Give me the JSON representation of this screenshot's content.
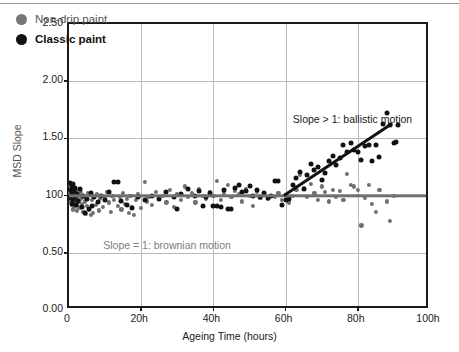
{
  "chart_data": {
    "type": "scatter",
    "title": "",
    "xlabel": "Ageing Time (hours)",
    "ylabel": "MSD Slope",
    "xlim": [
      0,
      100
    ],
    "ylim": [
      0.0,
      2.5
    ],
    "grid": true,
    "legend_position": "top-left",
    "x_ticks": [
      {
        "value": 0,
        "label": "0"
      },
      {
        "value": 20,
        "label": "20h"
      },
      {
        "value": 40,
        "label": "40h"
      },
      {
        "value": 60,
        "label": "60h"
      },
      {
        "value": 80,
        "label": "80h"
      },
      {
        "value": 100,
        "label": "100h"
      }
    ],
    "y_ticks": [
      {
        "value": 2.5,
        "label": "2.50"
      },
      {
        "value": 2.0,
        "label": "2.00"
      },
      {
        "value": 1.5,
        "label": "1.50"
      },
      {
        "value": 1.0,
        "label": "100"
      },
      {
        "value": 0.5,
        "label": "0.50"
      },
      {
        "value": 0.0,
        "label": "0.00"
      }
    ],
    "legend": [
      {
        "name": "Non-drip paint",
        "color": "#777777",
        "marker": "circle",
        "bold": false
      },
      {
        "name": "Classic paint",
        "color": "#111111",
        "marker": "circle",
        "bold": true
      }
    ],
    "annotations": [
      {
        "text": "Slope > 1: ballistic motion",
        "x": 62.0,
        "y": 1.72,
        "color": "#1a1a1a"
      },
      {
        "text": "Slope = 1: brownian motion",
        "x": 9.5,
        "y": 0.62,
        "color": "#7d7d7d"
      }
    ],
    "reference_lines": [
      {
        "name": "brownian",
        "type": "horizontal",
        "y": 1.0,
        "x_start": 0,
        "x_end": 100,
        "color": "#6f6f6f",
        "width": 3.4
      },
      {
        "name": "ballistic",
        "type": "segment",
        "x_start": 59.5,
        "y_start": 1.0,
        "x_end": 89.5,
        "y_end": 1.63,
        "color": "#111111",
        "width": 3.2
      }
    ],
    "series": [
      {
        "name": "Non-drip paint",
        "color": "#6f6f6f",
        "marker_size": 4.2,
        "points": [
          [
            0.3,
            1.09
          ],
          [
            0.4,
            1.02
          ],
          [
            0.5,
            0.95
          ],
          [
            0.5,
            1.06
          ],
          [
            0.6,
            0.99
          ],
          [
            0.7,
            0.92
          ],
          [
            0.8,
            1.04
          ],
          [
            0.9,
            0.97
          ],
          [
            1.0,
            1.01
          ],
          [
            1.0,
            0.88
          ],
          [
            1.1,
            1.07
          ],
          [
            1.2,
            0.94
          ],
          [
            1.3,
            1.0
          ],
          [
            1.4,
            0.9
          ],
          [
            1.5,
            1.03
          ],
          [
            1.6,
            0.96
          ],
          [
            1.7,
            1.05
          ],
          [
            1.8,
            0.93
          ],
          [
            1.9,
            0.99
          ],
          [
            2.0,
            1.02
          ],
          [
            2.1,
            0.87
          ],
          [
            2.2,
            0.98
          ],
          [
            2.3,
            1.04
          ],
          [
            2.4,
            0.91
          ],
          [
            2.5,
            1.0
          ],
          [
            2.6,
            0.95
          ],
          [
            2.8,
            1.01
          ],
          [
            3.0,
            0.89
          ],
          [
            3.2,
            0.97
          ],
          [
            3.4,
            1.03
          ],
          [
            3.6,
            0.93
          ],
          [
            3.8,
            0.99
          ],
          [
            4.0,
            0.86
          ],
          [
            4.2,
            1.0
          ],
          [
            4.4,
            0.95
          ],
          [
            4.6,
            0.84
          ],
          [
            4.8,
            0.98
          ],
          [
            5.0,
            0.91
          ],
          [
            5.3,
            1.02
          ],
          [
            5.6,
            0.88
          ],
          [
            6.0,
            0.83
          ],
          [
            6.3,
            0.96
          ],
          [
            6.6,
            0.85
          ],
          [
            7.0,
            0.99
          ],
          [
            7.4,
            0.92
          ],
          [
            7.8,
            1.01
          ],
          [
            8.2,
            0.87
          ],
          [
            8.6,
            0.97
          ],
          [
            9.0,
            1.0
          ],
          [
            9.5,
            0.9
          ],
          [
            10.0,
            0.98
          ],
          [
            10.5,
            1.03
          ],
          [
            11.0,
            0.94
          ],
          [
            11.5,
            0.86
          ],
          [
            12.0,
            1.0
          ],
          [
            12.5,
            0.96
          ],
          [
            13.0,
            1.12
          ],
          [
            13.5,
            0.91
          ],
          [
            14.0,
            0.99
          ],
          [
            14.5,
            0.88
          ],
          [
            15.0,
            1.02
          ],
          [
            15.5,
            0.93
          ],
          [
            16.0,
            0.97
          ],
          [
            16.5,
            0.85
          ],
          [
            17.0,
            1.0
          ],
          [
            17.5,
            0.9
          ],
          [
            18.0,
            0.83
          ],
          [
            18.5,
            0.96
          ],
          [
            19.0,
            1.01
          ],
          [
            20.0,
            0.89
          ],
          [
            21.0,
            1.12
          ],
          [
            21.5,
            0.95
          ],
          [
            22.0,
            0.99
          ],
          [
            23.0,
            0.92
          ],
          [
            24.0,
            1.03
          ],
          [
            25.0,
            0.97
          ],
          [
            26.0,
            1.0
          ],
          [
            27.0,
            0.94
          ],
          [
            28.0,
            1.05
          ],
          [
            29.0,
            0.9
          ],
          [
            30.0,
            1.01
          ],
          [
            31.0,
            0.96
          ],
          [
            32.0,
            1.08
          ],
          [
            33.0,
            0.99
          ],
          [
            34.0,
            1.02
          ],
          [
            35.0,
            0.94
          ],
          [
            36.0,
            1.06
          ],
          [
            37.0,
            1.0
          ],
          [
            38.0,
            0.97
          ],
          [
            39.0,
            1.03
          ],
          [
            40.0,
            1.0
          ],
          [
            41.0,
            1.13
          ],
          [
            42.0,
            0.96
          ],
          [
            43.0,
            1.02
          ],
          [
            44.0,
            1.09
          ],
          [
            45.0,
            0.99
          ],
          [
            46.0,
            1.04
          ],
          [
            47.0,
            1.01
          ],
          [
            48.0,
            0.95
          ],
          [
            49.0,
            1.06
          ],
          [
            50.0,
            1.0
          ],
          [
            51.0,
            0.91
          ],
          [
            52.0,
            1.03
          ],
          [
            53.0,
            0.98
          ],
          [
            54.0,
            1.01
          ],
          [
            55.0,
            0.97
          ],
          [
            56.0,
            1.0
          ],
          [
            57.0,
            0.99
          ],
          [
            58.0,
            1.02
          ],
          [
            59.0,
            0.96
          ],
          [
            60.0,
            1.0
          ],
          [
            61.0,
            0.94
          ],
          [
            62.0,
            1.0
          ],
          [
            63.0,
            1.05
          ],
          [
            64.0,
            1.18
          ],
          [
            65.0,
            1.07
          ],
          [
            66.0,
            0.99
          ],
          [
            67.0,
            1.1
          ],
          [
            68.0,
            1.02
          ],
          [
            69.0,
            0.96
          ],
          [
            70.0,
            1.08
          ],
          [
            71.0,
            1.03
          ],
          [
            72.0,
            0.95
          ],
          [
            73.0,
            1.05
          ],
          [
            74.0,
            0.99
          ],
          [
            75.0,
            1.04
          ],
          [
            76.0,
            0.96
          ],
          [
            77.0,
            1.19
          ],
          [
            78.0,
            1.09
          ],
          [
            79.0,
            1.08
          ],
          [
            80.0,
            1.05
          ],
          [
            81.0,
            0.74
          ],
          [
            82.0,
            0.98
          ],
          [
            83.0,
            1.09
          ],
          [
            84.0,
            0.93
          ],
          [
            85.0,
            0.86
          ],
          [
            86.0,
            1.05
          ],
          [
            88.0,
            0.95
          ],
          [
            89.0,
            0.78
          ],
          [
            90.0,
            1.0
          ]
        ]
      },
      {
        "name": "Classic paint",
        "color": "#121212",
        "marker_size": 5.0,
        "points": [
          [
            0.4,
            1.11
          ],
          [
            0.5,
            1.05
          ],
          [
            0.6,
            0.98
          ],
          [
            0.7,
            1.08
          ],
          [
            0.8,
            0.93
          ],
          [
            0.9,
            1.02
          ],
          [
            1.0,
            1.1
          ],
          [
            1.2,
            0.96
          ],
          [
            1.4,
            1.04
          ],
          [
            1.6,
            0.99
          ],
          [
            1.8,
            1.07
          ],
          [
            2.0,
            0.92
          ],
          [
            2.3,
            1.01
          ],
          [
            2.6,
            0.95
          ],
          [
            3.0,
            1.06
          ],
          [
            3.5,
            0.9
          ],
          [
            4.0,
            1.0
          ],
          [
            4.5,
            0.85
          ],
          [
            5.0,
            0.97
          ],
          [
            5.5,
            0.88
          ],
          [
            6.0,
            1.02
          ],
          [
            6.5,
            0.91
          ],
          [
            7.0,
            0.99
          ],
          [
            8.0,
            0.94
          ],
          [
            9.0,
            1.0
          ],
          [
            10.0,
            0.96
          ],
          [
            11.0,
            1.03
          ],
          [
            12.5,
            1.12
          ],
          [
            13.5,
            1.12
          ],
          [
            14.5,
            0.95
          ],
          [
            16.0,
            0.92
          ],
          [
            17.5,
            0.89
          ],
          [
            19.0,
            0.99
          ],
          [
            21.0,
            0.96
          ],
          [
            23.0,
            1.0
          ],
          [
            25.0,
            0.97
          ],
          [
            27.0,
            1.03
          ],
          [
            29.0,
            0.99
          ],
          [
            30.0,
            0.88
          ],
          [
            31.0,
            1.01
          ],
          [
            33.0,
            1.06
          ],
          [
            35.0,
            1.0
          ],
          [
            36.0,
            1.04
          ],
          [
            37.0,
            0.91
          ],
          [
            38.0,
            0.99
          ],
          [
            39.0,
            1.02
          ],
          [
            40.0,
            0.91
          ],
          [
            41.0,
            0.91
          ],
          [
            42.0,
            0.9
          ],
          [
            43.0,
            1.05
          ],
          [
            44.0,
            0.88
          ],
          [
            45.0,
            0.88
          ],
          [
            46.0,
            1.07
          ],
          [
            47.0,
            1.09
          ],
          [
            48.0,
            1.03
          ],
          [
            49.0,
            1.04
          ],
          [
            50.0,
            1.08
          ],
          [
            51.0,
            1.0
          ],
          [
            52.0,
            1.05
          ],
          [
            53.0,
            0.99
          ],
          [
            54.0,
            1.02
          ],
          [
            55.0,
            0.98
          ],
          [
            56.0,
            1.0
          ],
          [
            57.0,
            1.13
          ],
          [
            58.0,
            1.13
          ],
          [
            59.0,
            0.92
          ],
          [
            60.0,
            0.96
          ],
          [
            61.0,
            0.97
          ],
          [
            62.0,
            1.09
          ],
          [
            63.0,
            1.15
          ],
          [
            64.0,
            1.21
          ],
          [
            65.0,
            1.06
          ],
          [
            66.0,
            1.18
          ],
          [
            67.0,
            1.28
          ],
          [
            68.0,
            1.22
          ],
          [
            69.0,
            1.25
          ],
          [
            70.0,
            1.14
          ],
          [
            71.0,
            1.2
          ],
          [
            72.0,
            1.3
          ],
          [
            73.0,
            1.35
          ],
          [
            74.0,
            1.27
          ],
          [
            75.0,
            1.33
          ],
          [
            76.0,
            1.44
          ],
          [
            77.0,
            1.38
          ],
          [
            78.0,
            1.46
          ],
          [
            79.0,
            1.4
          ],
          [
            80.0,
            1.38
          ],
          [
            81.0,
            1.31
          ],
          [
            82.0,
            1.43
          ],
          [
            83.0,
            1.44
          ],
          [
            84.0,
            1.3
          ],
          [
            85.0,
            1.44
          ],
          [
            86.0,
            1.34
          ],
          [
            87.0,
            1.63
          ],
          [
            88.0,
            1.72
          ],
          [
            89.0,
            1.62
          ],
          [
            90.0,
            1.46
          ],
          [
            90.5,
            1.47
          ],
          [
            91.0,
            1.62
          ]
        ]
      }
    ]
  }
}
